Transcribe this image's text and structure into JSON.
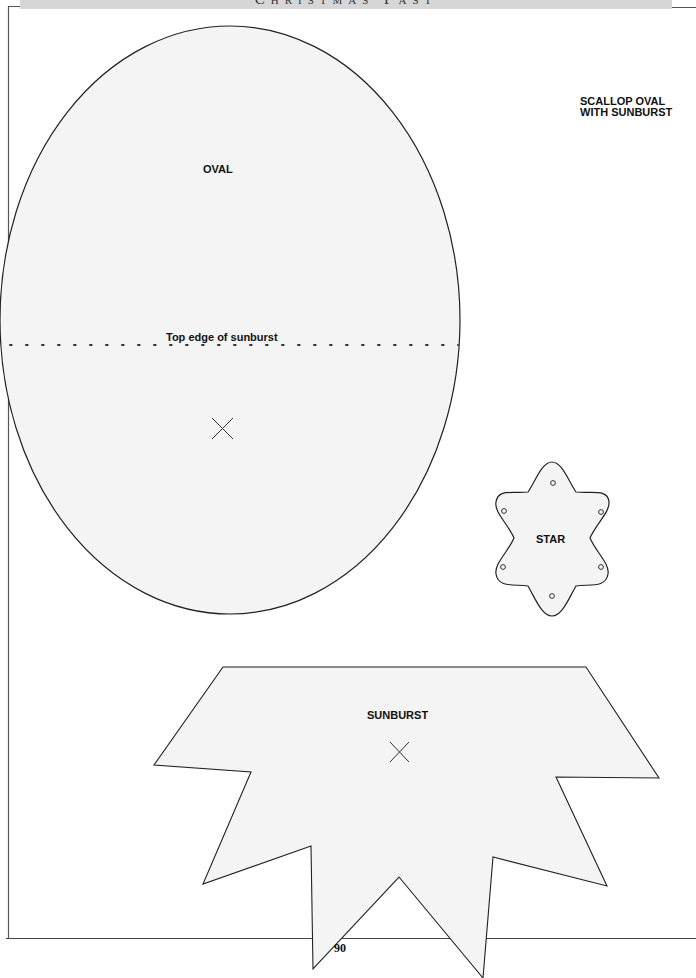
{
  "header": {
    "title": "Christmas Past"
  },
  "pattern_title": {
    "line1": "SCALLOP OVAL",
    "line2": "WITH SUNBURST"
  },
  "shapes": {
    "oval": {
      "label": "OVAL",
      "guide_label": "Top edge of sunburst"
    },
    "star": {
      "label": "STAR"
    },
    "sunburst": {
      "label": "SUNBURST"
    }
  },
  "footer": {
    "page_number": "90"
  },
  "colors": {
    "fill": "#f4f4f4",
    "stroke": "#222222",
    "header_band": "#d6d6d6"
  }
}
